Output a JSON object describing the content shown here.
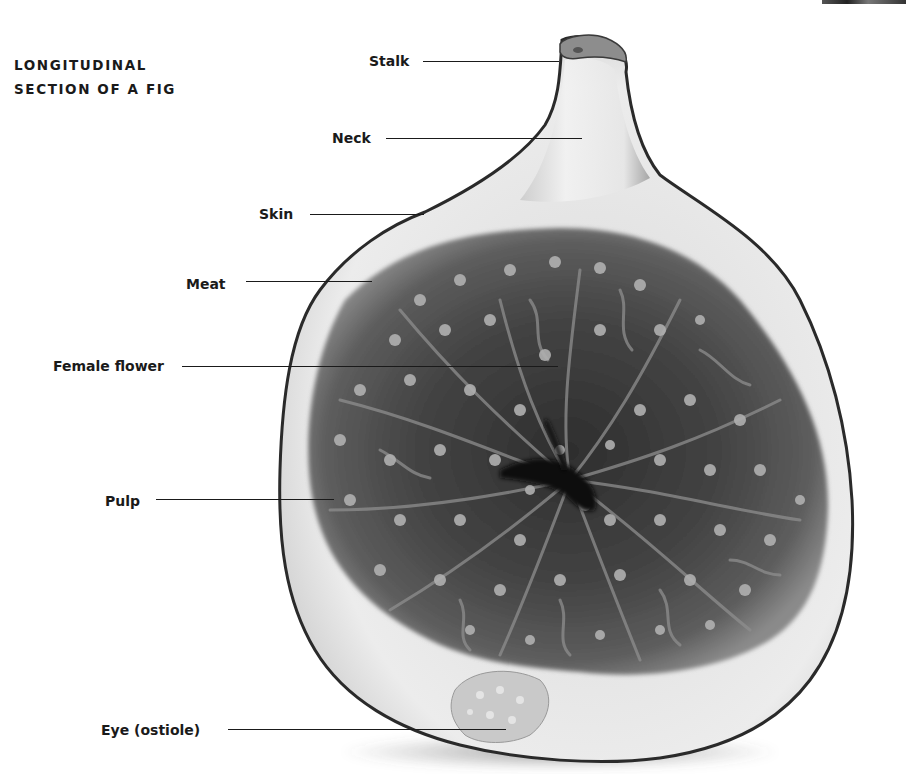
{
  "title": {
    "line1": "LONGITUDINAL",
    "line2": "SECTION OF A FIG"
  },
  "labels": [
    {
      "id": "stalk",
      "text": "Stalk"
    },
    {
      "id": "neck",
      "text": "Neck"
    },
    {
      "id": "skin",
      "text": "Skin"
    },
    {
      "id": "meat",
      "text": "Meat"
    },
    {
      "id": "female-flower",
      "text": "Female flower"
    },
    {
      "id": "pulp",
      "text": "Pulp"
    },
    {
      "id": "eye",
      "text": "Eye (ostiole)"
    }
  ],
  "image": {
    "subject": "fig-longitudinal-section",
    "palette": {
      "skin_outline": "#2a2a2a",
      "meat": "#e6e6e6",
      "pulp_dark": "#3a3a3a",
      "pulp_mid": "#6a6a6a",
      "seed": "#a8a8a8",
      "cavity": "#0e0e0e"
    }
  }
}
